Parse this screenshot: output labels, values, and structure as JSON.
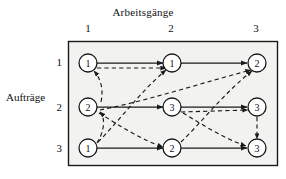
{
  "figure": {
    "top_axis_title": "Arbeitsgänge",
    "left_axis_title": "Aufträge",
    "column_headers": [
      "1",
      "2",
      "3"
    ],
    "row_headers": [
      "1",
      "2",
      "3"
    ],
    "colors": {
      "line": "#1a1a1a",
      "node_fill": "#ffffff",
      "frame": "#1a1a1a",
      "panel_bg": "#f2f2f0"
    },
    "nodes": [
      [
        {
          "label": "1"
        },
        {
          "label": "1"
        },
        {
          "label": "2"
        }
      ],
      [
        {
          "label": "2"
        },
        {
          "label": "3"
        },
        {
          "label": "3"
        }
      ],
      [
        {
          "label": "1"
        },
        {
          "label": "2"
        },
        {
          "label": "3"
        }
      ]
    ],
    "solid_edges": [
      {
        "from": "r1c1",
        "to": "r1c2"
      },
      {
        "from": "r1c2",
        "to": "r1c3"
      },
      {
        "from": "r2c1",
        "to": "r2c2"
      },
      {
        "from": "r2c2",
        "to": "r2c3"
      },
      {
        "from": "r3c1",
        "to": "r3c2"
      },
      {
        "from": "r3c2",
        "to": "r3c3"
      }
    ],
    "dashed_edges": [
      {
        "from": "r1c1",
        "to": "r1c2"
      },
      {
        "from": "r2c1",
        "to": "r1c1"
      },
      {
        "from": "r3c1",
        "to": "r1c2"
      },
      {
        "from": "r3c1",
        "to": "r2c1"
      },
      {
        "from": "r2c1",
        "to": "r3c2"
      },
      {
        "from": "r2c2",
        "to": "r2c3"
      },
      {
        "from": "r2c2",
        "to": "r3c3"
      },
      {
        "from": "r3c2",
        "to": "r1c3"
      },
      {
        "from": "r2c3",
        "to": "r3c3"
      },
      {
        "from": "r1c2",
        "to": "r1c3"
      }
    ]
  }
}
